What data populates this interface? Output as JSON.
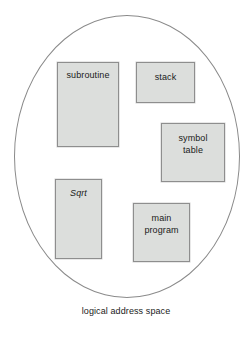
{
  "figure": {
    "caption": "logical address space",
    "container_shape": "ellipse",
    "colors": {
      "segment_fill": "#dcdedc",
      "segment_border": "#8e8e8e",
      "ellipse_stroke": "#8a8a8a",
      "text": "#1a1a1a",
      "background": "#ffffff"
    },
    "segments": [
      {
        "id": "subroutine",
        "label": "subroutine",
        "style": "normal"
      },
      {
        "id": "stack",
        "label": "stack",
        "style": "normal"
      },
      {
        "id": "symbol_table",
        "label": "symbol\ntable",
        "style": "normal"
      },
      {
        "id": "sqrt",
        "label": "Sqrt",
        "style": "italic"
      },
      {
        "id": "main_program",
        "label": "main\nprogram",
        "style": "normal"
      }
    ]
  }
}
